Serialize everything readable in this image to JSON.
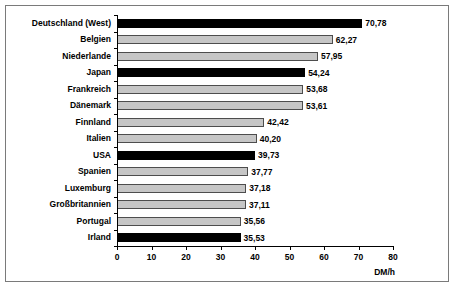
{
  "chart_data": {
    "type": "bar",
    "orientation": "horizontal",
    "title": "",
    "xlabel": "DM/h",
    "ylabel": "",
    "xlim": [
      0,
      80
    ],
    "xticks": [
      0,
      10,
      20,
      30,
      40,
      50,
      60,
      70,
      80
    ],
    "xtick_labels": [
      "0",
      "10",
      "20",
      "30",
      "40",
      "50",
      "60",
      "70",
      "80"
    ],
    "grid": false,
    "legend": "none",
    "categories": [
      "Deutschland (West)",
      "Belgien",
      "Niederlande",
      "Japan",
      "Frankreich",
      "Dänemark",
      "Finnland",
      "Italien",
      "USA",
      "Spanien",
      "Luxemburg",
      "Großbritannien",
      "Portugal",
      "Irland"
    ],
    "values": [
      70.78,
      62.27,
      57.95,
      54.24,
      53.68,
      53.61,
      42.42,
      40.2,
      39.73,
      37.77,
      37.18,
      37.11,
      35.56,
      35.53
    ],
    "value_labels": [
      "70,78",
      "62,27",
      "57,95",
      "54,24",
      "53,68",
      "53,61",
      "42,42",
      "40,20",
      "39,73",
      "37,77",
      "37,18",
      "37,11",
      "35,56",
      "35,53"
    ],
    "bar_styles": [
      "black",
      "gray",
      "gray",
      "black",
      "gray",
      "gray",
      "gray",
      "gray",
      "black",
      "gray",
      "gray",
      "gray",
      "gray",
      "black"
    ],
    "colors": {
      "black_bar": "#000000",
      "gray_bar": "#c6c6c6",
      "gray_bar_border": "#4d4d4d",
      "axis": "#000000",
      "frame": "#7a7a7a",
      "background": "#ffffff",
      "text": "#000000"
    }
  }
}
